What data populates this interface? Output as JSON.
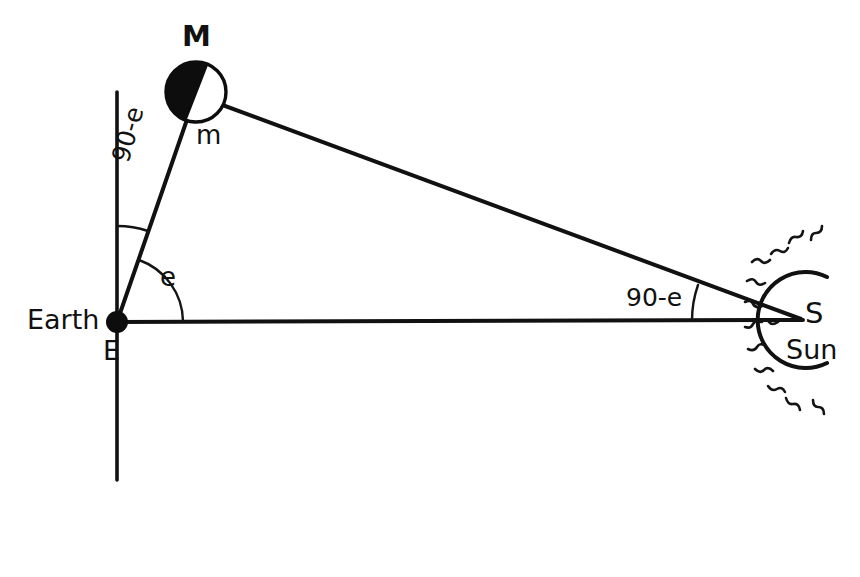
{
  "figure": {
    "ink_color": "#111111",
    "background_color": "#ffffff"
  },
  "labels": {
    "moon_point": "M",
    "moon_angle": "m",
    "earth_name": "Earth",
    "earth_point": "E",
    "sun_point": "S",
    "sun_name": "Sun",
    "angle_at_earth": "e",
    "angle_at_earth_complement": "90-e",
    "angle_at_sun": "90-e"
  },
  "geometry": {
    "earth": {
      "x": 117,
      "y": 322,
      "radius": 11,
      "fill": "#0d0d0d"
    },
    "moon": {
      "x": 196,
      "y": 92,
      "radius": 30,
      "dark_fill": "#0d0d0d",
      "light_fill": "#ffffff"
    },
    "sun": {
      "x": 800,
      "y": 320,
      "arc_radius": 48,
      "ray_count": 13
    },
    "vertical_line": {
      "x": 117,
      "y_top": 92,
      "y_bottom": 480
    },
    "earth_sun_line": {
      "x1": 117,
      "y1": 322,
      "x2": 800,
      "y2": 320
    },
    "earth_moon_line": {
      "x1": 117,
      "y1": 322,
      "x2": 196,
      "y2": 92
    },
    "moon_sun_line": {
      "x1": 196,
      "y1": 92,
      "x2": 800,
      "y2": 320
    },
    "arc_e": {
      "center_x": 117,
      "center_y": 322,
      "radius": 66
    },
    "arc_90_minus_e": {
      "center_x": 117,
      "center_y": 322,
      "radius": 96
    },
    "arc_at_sun": {
      "center_x": 800,
      "center_y": 320,
      "radius": 108
    }
  },
  "angles": {
    "at_earth_degrees": 71,
    "at_sun_degrees": 19,
    "at_moon_degrees": 90
  }
}
